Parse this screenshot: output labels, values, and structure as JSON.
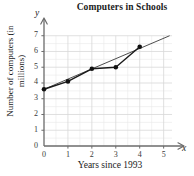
{
  "chart_data": {
    "type": "scatter",
    "title": "Computers in Schools",
    "xlabel": "Years since 1993",
    "ylabel": "Number of computers (in millions)",
    "x_axis_variable": "x",
    "y_axis_variable": "y",
    "xlim": [
      0,
      5.6
    ],
    "ylim": [
      0,
      7.3
    ],
    "xticks": [
      0,
      1,
      2,
      3,
      4,
      5
    ],
    "yticks": [
      0,
      1,
      2,
      3,
      4,
      5,
      6,
      7
    ],
    "xtick_labels": [
      "0",
      "1",
      "2",
      "3",
      "4",
      "5"
    ],
    "ytick_labels": [
      "0",
      "1",
      "2",
      "3",
      "4",
      "5",
      "6",
      "7"
    ],
    "grid": true,
    "minor_grid": true,
    "minor_grid_step": 0.5,
    "legend": null,
    "x": [
      0,
      1,
      2,
      3,
      4
    ],
    "values": [
      3.6,
      4.1,
      4.9,
      5.0,
      6.3
    ],
    "points": [
      {
        "x": 0,
        "y": 3.6
      },
      {
        "x": 1,
        "y": 4.1
      },
      {
        "x": 2,
        "y": 4.9
      },
      {
        "x": 3,
        "y": 5.0
      },
      {
        "x": 4,
        "y": 6.3
      }
    ],
    "series": [
      {
        "name": "data",
        "style": "connected-markers",
        "color": "#1a1a1a",
        "values": [
          3.6,
          4.1,
          4.9,
          5.0,
          6.3
        ]
      },
      {
        "name": "trend-line",
        "style": "line",
        "color": "#3a3a3a",
        "from": {
          "x": 0,
          "y": 3.6
        },
        "to": {
          "x": 5.25,
          "y": 7.0
        }
      }
    ],
    "colors": {
      "marker": "#111111",
      "data_line": "#1a1a1a",
      "trend_line": "#444444",
      "grid": "#d8d8d8",
      "minor_grid": "#eaeaea",
      "axis": "#6b6b6b",
      "text": "#1a1a1a",
      "background": "#ffffff"
    }
  }
}
